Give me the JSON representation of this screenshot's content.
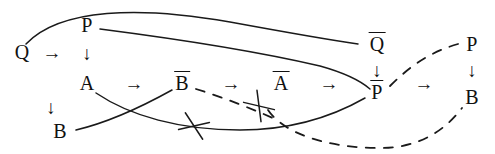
{
  "figure": {
    "stroke_color": "#1a1a1a",
    "background_color": "#ffffff",
    "width": 495,
    "height": 154
  },
  "nodes": [
    {
      "id": "Q",
      "label": "Q",
      "overline": false,
      "x": 22,
      "y": 52
    },
    {
      "id": "P",
      "label": "P",
      "overline": false,
      "x": 87,
      "y": 25
    },
    {
      "id": "A",
      "label": "A",
      "overline": false,
      "x": 87,
      "y": 83
    },
    {
      "id": "B",
      "label": "B",
      "overline": false,
      "x": 60,
      "y": 131
    },
    {
      "id": "Bbar",
      "label": "B",
      "overline": true,
      "x": 182,
      "y": 83
    },
    {
      "id": "Abar",
      "label": "A",
      "overline": true,
      "x": 281,
      "y": 83
    },
    {
      "id": "Qbar",
      "label": "Q",
      "overline": true,
      "x": 377,
      "y": 44
    },
    {
      "id": "Pbar",
      "label": "P",
      "overline": true,
      "x": 377,
      "y": 92
    },
    {
      "id": "P2",
      "label": "P",
      "overline": false,
      "x": 472,
      "y": 44
    },
    {
      "id": "B2",
      "label": "B",
      "overline": false,
      "x": 472,
      "y": 97
    }
  ],
  "arrows": [
    {
      "id": "q-to-p-col",
      "glyph": "→",
      "x": 52,
      "y": 52,
      "from": "Q",
      "to": "P-column"
    },
    {
      "id": "p-to-a",
      "glyph": "↓",
      "x": 87,
      "y": 53,
      "from": "P",
      "to": "A"
    },
    {
      "id": "a-to-bbar",
      "glyph": "→",
      "x": 134,
      "y": 83,
      "from": "A",
      "to": "Bbar"
    },
    {
      "id": "a-to-b",
      "glyph": "↓",
      "x": 51,
      "y": 107,
      "from": "A",
      "to": "B"
    },
    {
      "id": "bbar-to-abar",
      "glyph": "→",
      "x": 231,
      "y": 83,
      "from": "Bbar",
      "to": "Abar"
    },
    {
      "id": "abar-to-pbar",
      "glyph": "→",
      "x": 329,
      "y": 83,
      "from": "Abar",
      "to": "Pbar"
    },
    {
      "id": "qbar-to-pbar",
      "glyph": "↓",
      "x": 377,
      "y": 70,
      "from": "Qbar",
      "to": "Pbar"
    },
    {
      "id": "pbar-to-p2",
      "glyph": "→",
      "x": 424,
      "y": 83,
      "from": "Pbar",
      "to": "P2"
    },
    {
      "id": "p2-to-b2",
      "glyph": "↓",
      "x": 472,
      "y": 70,
      "from": "P2",
      "to": "B2"
    }
  ],
  "connectors": [
    {
      "id": "q-to-qbar-curve",
      "style": "solid",
      "from": "Q",
      "to": "Qbar",
      "path": "M 26,44 C 60,8 140,6 230,22 C 290,33 330,40 358,44"
    },
    {
      "id": "p-to-pbar-curve",
      "style": "solid",
      "from": "P",
      "to": "Pbar",
      "path": "M 100,29 C 170,38 260,52 320,66 C 345,73 362,82 370,89"
    },
    {
      "id": "a-to-lower-curve",
      "style": "solid",
      "from": "A",
      "to": "Pbar",
      "path": "M 96,93 C 130,116 180,130 240,130 C 290,130 330,118 365,98"
    },
    {
      "id": "b-to-bbar-curve",
      "style": "solid",
      "from": "B",
      "to": "Bbar",
      "path": "M 76,130 C 110,122 145,105 172,90"
    },
    {
      "id": "bbar-to-pbar-dashed",
      "style": "dashed",
      "from": "Bbar",
      "to": "Pbar",
      "path": "M 196,89 C 225,98 255,110 275,119"
    },
    {
      "id": "abar-to-b2-dashed",
      "style": "dashed",
      "from": "Abar",
      "to": "B2",
      "path": "M 268,110 C 285,135 330,148 380,148 C 420,148 445,130 462,108"
    },
    {
      "id": "pbar-to-p2-dashed",
      "style": "dashed",
      "from": "Pbar",
      "to": "P2",
      "path": "M 390,86 C 410,66 430,52 458,44"
    }
  ],
  "cross_marks": [
    {
      "id": "cross-on-lower-curve",
      "x": 194,
      "y": 126,
      "angle": 22
    },
    {
      "id": "cross-on-abar-dashed",
      "x": 259,
      "y": 106,
      "angle": 48
    }
  ],
  "crossings": [
    {
      "id": "crossing-a-b-curves",
      "x": 115,
      "y": 116
    }
  ]
}
